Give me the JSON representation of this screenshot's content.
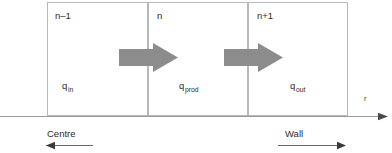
{
  "diagram": {
    "cells": [
      {
        "id": "cell-n-minus-1",
        "label": "n–1",
        "q_base": "q",
        "q_sub": "in"
      },
      {
        "id": "cell-n",
        "label": "n",
        "q_base": "q",
        "q_sub": "prod"
      },
      {
        "id": "cell-n-plus-1",
        "label": "n+1",
        "q_base": "q",
        "q_sub": "out"
      }
    ],
    "axis": {
      "label": "r",
      "direction": "right"
    },
    "regions": [
      {
        "id": "centre",
        "label": "Centre",
        "direction": "left"
      },
      {
        "id": "wall",
        "label": "Wall",
        "direction": "right"
      }
    ],
    "flow_arrows": [
      {
        "id": "flow-arrow-1",
        "direction": "right"
      },
      {
        "id": "flow-arrow-2",
        "direction": "right"
      }
    ],
    "colors": {
      "arrow_fill": "#8c8c8c",
      "box_stroke": "#b8b8b8",
      "axis_stroke": "#9a9a9a",
      "region_arrow_stroke": "#4a4a4a",
      "text": "#2b2b2b",
      "background": "#ffffff"
    }
  }
}
